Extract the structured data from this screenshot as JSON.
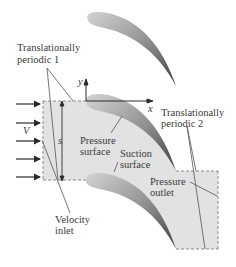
{
  "diagram": {
    "colors": {
      "domain_fill": "#e2e2e2",
      "dashed_boundary": "#8a8a8a",
      "blade_light": "#c8c8c8",
      "blade_dark": "#4a4a4a",
      "leader_line": "#555555",
      "text": "#3a3a3a",
      "background": "#ffffff"
    },
    "labels": {
      "periodic1_line1": "Translationally",
      "periodic1_line2": "periodic 1",
      "periodic2_line1": "Translationally",
      "periodic2_line2": "periodic 2",
      "pressure_surface_line1": "Pressure",
      "pressure_surface_line2": "surface",
      "suction_surface_line1": "Suction",
      "suction_surface_line2": "surface",
      "pressure_outlet_line1": "Pressure",
      "pressure_outlet_line2": "outlet",
      "velocity_inlet_line1": "Velocity",
      "velocity_inlet_line2": "inlet",
      "velocity_symbol": "V",
      "spacing_symbol": "s",
      "x_axis": "x",
      "y_axis": "y"
    },
    "inlet_arrow_count": 5,
    "blade_count": 3
  }
}
